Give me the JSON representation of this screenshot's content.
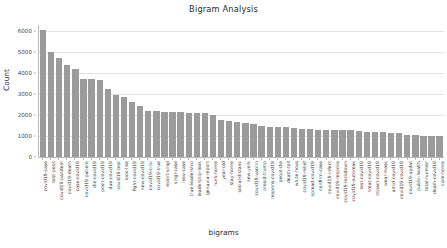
{
  "chart_data": {
    "type": "bar",
    "title": "Bigram Analysis",
    "xlabel": "bigrams",
    "ylabel": "Count",
    "ylim": [
      0,
      6300
    ],
    "yticks": [
      0,
      1000,
      2000,
      3000,
      4000,
      5000,
      6000
    ],
    "ytick_labels": [
      "0",
      "1000",
      "2000",
      "3000",
      "4000",
      "5000",
      "6000"
    ],
    "grid": true,
    "legend": false,
    "bar_color": "#9b9b9b",
    "categories": [
      "covid19-case",
      "test-posit",
      "covid19-pandem",
      "covid19-death",
      "case-covid19",
      "covid19-patient",
      "die-covid19",
      "posit-covid19",
      "due-covid19",
      "covid19-test",
      "look-like",
      "fight-covid19",
      "new-covid19",
      "covid19-crisi",
      "covid19-true",
      "report-singl",
      "singl-case",
      "new-case",
      "true-leadership",
      "leadership-look",
      "genuvia-report",
      "nurs-home",
      "year-old",
      "stay-home",
      "social-distanc",
      "new-york",
      "covid19-vaccin",
      "presid-trump",
      "respons-covid19",
      "peopl-die",
      "death-toll",
      "white-hous",
      "covid19-relief",
      "spread-covid19",
      "confirm-case",
      "covid19-infect",
      "covid19-respons",
      "covid19-lockdown",
      "covid19-outbreak",
      "test-covid19",
      "treat-covid19",
      "impact-covid19",
      "wear-mask",
      "amid-covid19",
      "covid19-covid19",
      "covid19-updat",
      "public-health",
      "total-number",
      "death-covid19",
      "care-home"
    ],
    "values": [
      6050,
      5000,
      4710,
      4400,
      4180,
      3720,
      3720,
      3660,
      3250,
      2960,
      2860,
      2620,
      2420,
      2190,
      2180,
      2130,
      2130,
      2130,
      2120,
      2110,
      2100,
      2010,
      1750,
      1710,
      1660,
      1640,
      1580,
      1490,
      1440,
      1440,
      1420,
      1400,
      1340,
      1320,
      1310,
      1300,
      1280,
      1270,
      1270,
      1240,
      1190,
      1180,
      1180,
      1140,
      1130,
      1060,
      1030,
      1010,
      1010,
      1010
    ]
  }
}
